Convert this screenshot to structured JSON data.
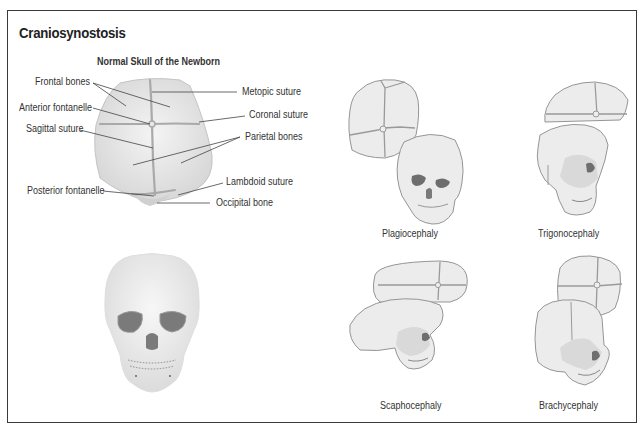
{
  "title": "Craniosynostosis",
  "normal_skull": {
    "heading": "Normal Skull of the Newborn",
    "labels": {
      "frontal_bones": "Frontal bones",
      "anterior_fontanelle": "Anterior fontanelle",
      "sagittal_suture": "Sagittal suture",
      "posterior_fontanelle": "Posterior fontanelle",
      "metopic_suture": "Metopic suture",
      "coronal_suture": "Coronal suture",
      "parietal_bones": "Parietal bones",
      "lambdoid_suture": "Lambdoid suture",
      "occipital_bone": "Occipital bone"
    }
  },
  "types": [
    {
      "name": "Plagiocephaly"
    },
    {
      "name": "Trigonocephaly"
    },
    {
      "name": "Scaphocephaly"
    },
    {
      "name": "Brachycephaly"
    }
  ],
  "colors": {
    "bone_fill": "#e8e8e8",
    "suture": "#a8a8a8",
    "outline": "#8a8a8a",
    "frame": "#3a3a3a"
  }
}
